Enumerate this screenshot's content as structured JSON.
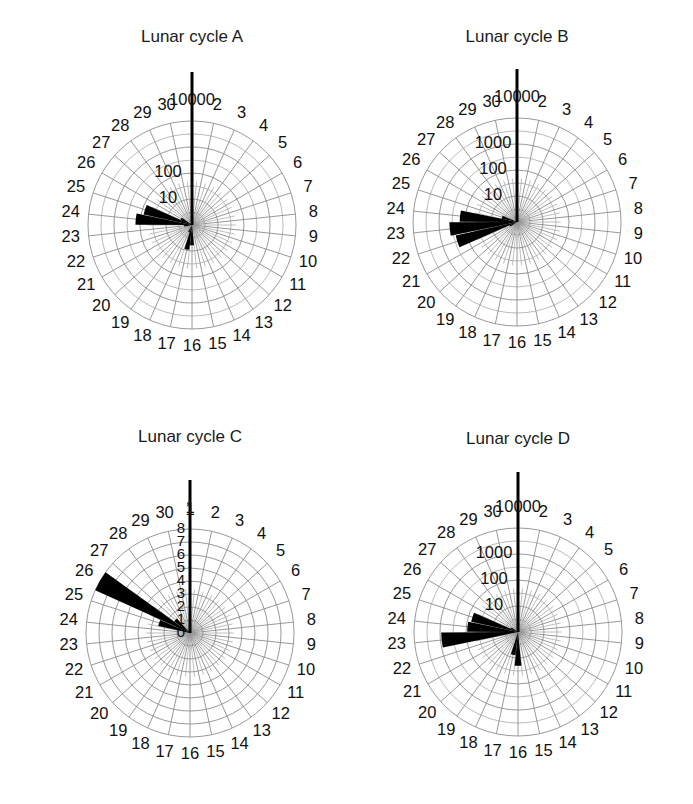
{
  "figure": {
    "width": 693,
    "height": 804,
    "background": "#ffffff",
    "grid_color": "#8c8c8c",
    "data_color": "#000000"
  },
  "panels": [
    {
      "id": "A",
      "title": "Lunar cycle A",
      "scale": "log",
      "radial_ticks": [
        "10",
        "100",
        "10000"
      ],
      "radial_tick_values": [
        10,
        100,
        10000
      ],
      "radial_axis_top_label": "10000",
      "angle_labels": [
        "1",
        "2",
        "3",
        "4",
        "5",
        "6",
        "7",
        "8",
        "9",
        "10",
        "11",
        "12",
        "13",
        "14",
        "15",
        "16",
        "17",
        "18",
        "19",
        "20",
        "21",
        "22",
        "23",
        "24",
        "25",
        "26",
        "27",
        "28",
        "29",
        "30"
      ]
    },
    {
      "id": "B",
      "title": "Lunar cycle B",
      "scale": "log",
      "radial_ticks": [
        "10",
        "100",
        "1000",
        "10000"
      ],
      "radial_tick_values": [
        10,
        100,
        1000,
        10000
      ],
      "radial_axis_top_label": "10000",
      "angle_labels": [
        "1",
        "2",
        "3",
        "4",
        "5",
        "6",
        "7",
        "8",
        "9",
        "10",
        "11",
        "12",
        "13",
        "14",
        "15",
        "16",
        "17",
        "18",
        "19",
        "20",
        "21",
        "22",
        "23",
        "24",
        "25",
        "26",
        "27",
        "28",
        "29",
        "30"
      ]
    },
    {
      "id": "C",
      "title": "Lunar cycle C",
      "scale": "linear",
      "radial_ticks": [
        "0",
        "1",
        "2",
        "3",
        "4",
        "5",
        "6",
        "7",
        "8"
      ],
      "radial_tick_values": [
        0,
        1,
        2,
        3,
        4,
        5,
        6,
        7,
        8
      ],
      "radial_axis_top_label": "8",
      "angle_labels": [
        "1",
        "2",
        "3",
        "4",
        "5",
        "6",
        "7",
        "8",
        "9",
        "10",
        "11",
        "12",
        "13",
        "14",
        "15",
        "16",
        "17",
        "18",
        "19",
        "20",
        "21",
        "22",
        "23",
        "24",
        "25",
        "26",
        "27",
        "28",
        "29",
        "30"
      ]
    },
    {
      "id": "D",
      "title": "Lunar cycle D",
      "scale": "log",
      "radial_ticks": [
        "10",
        "100",
        "1000",
        "10000"
      ],
      "radial_tick_values": [
        10,
        100,
        1000,
        10000
      ],
      "radial_axis_top_label": "10000",
      "angle_labels": [
        "1",
        "2",
        "3",
        "4",
        "5",
        "6",
        "7",
        "8",
        "9",
        "10",
        "11",
        "12",
        "13",
        "14",
        "15",
        "16",
        "17",
        "18",
        "19",
        "20",
        "21",
        "22",
        "23",
        "24",
        "25",
        "26",
        "27",
        "28",
        "29",
        "30"
      ]
    }
  ],
  "chart_data": {
    "type": "polar-wedge",
    "xlabel": "Lunar day",
    "ylabel": "Catch (log scale)",
    "grid": true,
    "legend": "none",
    "angular_categories": [
      1,
      2,
      3,
      4,
      5,
      6,
      7,
      8,
      9,
      10,
      11,
      12,
      13,
      14,
      15,
      16,
      17,
      18,
      19,
      20,
      21,
      22,
      23,
      24,
      25,
      26,
      27,
      28,
      29,
      30
    ],
    "angular_direction": "clockwise",
    "angular_zero_at": "top",
    "series": [
      {
        "name": "Lunar cycle A",
        "panel": "A",
        "scale": "log",
        "rlim": [
          1,
          10000
        ],
        "rticks": [
          10,
          100,
          10000
        ],
        "values": [
          0,
          0,
          0,
          0,
          0,
          0,
          0,
          0,
          0,
          0,
          0,
          0,
          0,
          0,
          0,
          6,
          9,
          2,
          0,
          0,
          0,
          0,
          2,
          150,
          80,
          3,
          0,
          0,
          0,
          0
        ]
      },
      {
        "name": "Lunar cycle B",
        "panel": "B",
        "scale": "log",
        "rlim": [
          1,
          10000
        ],
        "rticks": [
          10,
          100,
          1000,
          10000
        ],
        "values": [
          0,
          0,
          0,
          0,
          0,
          0,
          0,
          0,
          0,
          0,
          0,
          0,
          0,
          0,
          0,
          0,
          0,
          0,
          0,
          0,
          2,
          260,
          400,
          160,
          4,
          0,
          0,
          0,
          0,
          0
        ]
      },
      {
        "name": "Lunar cycle C",
        "panel": "C",
        "scale": "linear",
        "rlim": [
          0,
          8
        ],
        "rticks": [
          0,
          1,
          2,
          3,
          4,
          5,
          6,
          7,
          8
        ],
        "values": [
          0,
          0,
          0,
          0,
          0,
          0,
          0,
          0,
          0,
          0,
          0,
          0,
          0,
          0,
          0,
          0,
          0,
          0,
          0,
          0,
          0,
          0,
          0,
          0,
          2.5,
          8,
          1.5,
          0,
          0,
          0
        ]
      },
      {
        "name": "Lunar cycle D",
        "panel": "D",
        "scale": "log",
        "rlim": [
          1,
          10000
        ],
        "rticks": [
          10,
          100,
          1000,
          10000
        ],
        "values": [
          0,
          0,
          0,
          0,
          0,
          0,
          0,
          0,
          0,
          0,
          0,
          0,
          0,
          0,
          0,
          20,
          8,
          0,
          0,
          0,
          0,
          0,
          900,
          90,
          70,
          2,
          0,
          0,
          0,
          0
        ]
      }
    ]
  }
}
